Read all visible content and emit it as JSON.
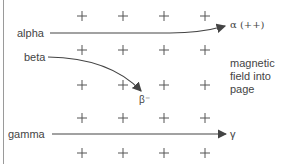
{
  "diagram": {
    "type": "radiation deflection in magnetic field",
    "labels": {
      "alpha_in": "alpha",
      "beta_in": "beta",
      "gamma_in": "gamma",
      "alpha_out": "α (++)",
      "beta_out": "β⁻",
      "gamma_out": "γ",
      "field_line1": "magnetic",
      "field_line2": "field into",
      "field_line3": "page"
    },
    "field_symbol": "+",
    "grid": {
      "columns": 4,
      "rows": 5
    },
    "colors": {
      "line": "#444444",
      "cross": "#555555",
      "frame": "#9a9a9a"
    }
  }
}
